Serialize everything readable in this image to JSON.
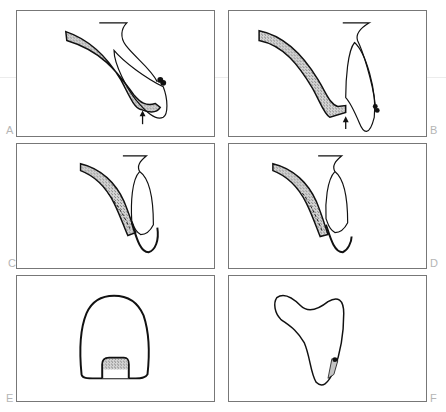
{
  "figure": {
    "panels": [
      {
        "id": "A",
        "label": "A",
        "content": "cross-section: hatched tissue band curving down to tooth, arrow pointing up at junction, small dark nodules on tooth surface"
      },
      {
        "id": "B",
        "label": "B",
        "content": "cross-section: hatched band descending to tooth base, arrow pointing up, small dark nodule on tooth"
      },
      {
        "id": "C",
        "label": "C",
        "content": "cross-section: hatched band with dashed inner line alongside tooth crown, dark base outline"
      },
      {
        "id": "D",
        "label": "D",
        "content": "cross-section: hatched band with dashed inner line alongside tooth crown, dark base outline"
      },
      {
        "id": "E",
        "label": "E",
        "content": "front view: dome-shaped tooth outline with hatched rectangular inset at base"
      },
      {
        "id": "F",
        "label": "F",
        "content": "outline: triangular tooth shape with small shaded tab near lower right"
      }
    ],
    "colors": {
      "line": "#111111",
      "hatch": "#9a9a9a",
      "border": "#777777",
      "label": "#b5b5b5"
    }
  }
}
